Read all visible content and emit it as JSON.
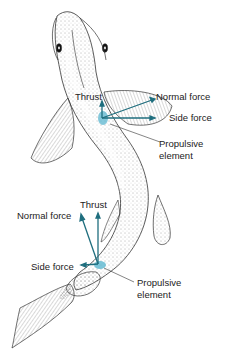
{
  "diagram": {
    "colors": {
      "vector": "#1f6e7e",
      "propulsive_patch": "#5bb6cf",
      "outline": "#333333",
      "label_text": "#222222"
    },
    "upper_group": {
      "thrust_label": "Thrust",
      "normal_force_label": "Normal force",
      "side_force_label": "Side force",
      "element_label_line1": "Propulsive",
      "element_label_line2": "element"
    },
    "lower_group": {
      "thrust_label": "Thrust",
      "normal_force_label": "Normal force",
      "side_force_label": "Side force",
      "element_label_line1": "Propulsive",
      "element_label_line2": "element"
    }
  }
}
